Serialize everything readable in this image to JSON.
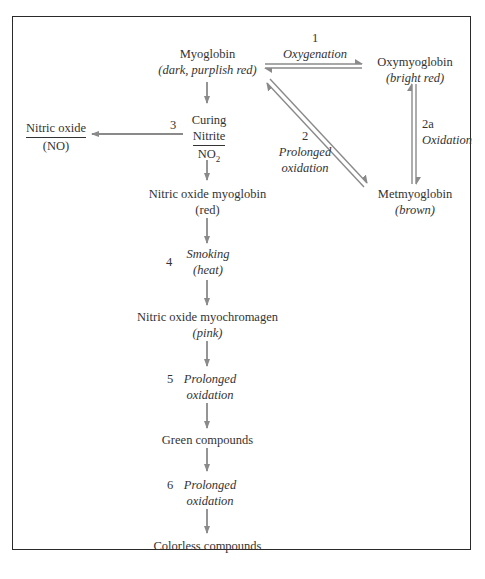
{
  "diagram": {
    "nodes": {
      "myoglobin": {
        "name": "Myoglobin",
        "color_desc": "(dark, purplish red)"
      },
      "oxymyoglobin": {
        "name": "Oxymyoglobin",
        "color_desc": "(bright red)"
      },
      "metmyoglobin": {
        "name": "Metmyoglobin",
        "color_desc": "(brown)"
      },
      "nitric_oxide": {
        "name": "Nitric oxide",
        "formula": "(NO)"
      },
      "nitric_oxide_myoglobin": {
        "name": "Nitric oxide myoglobin",
        "color_desc": "(red)"
      },
      "nitric_oxide_myochromagen": {
        "name": "Nitric oxide myochromagen",
        "color_desc": "(pink)"
      },
      "green_compounds": {
        "name": "Green compounds"
      },
      "colorless_compounds": {
        "name": "Colorless compounds"
      }
    },
    "steps": {
      "s1": {
        "num": "1",
        "label": "Oxygenation"
      },
      "s2": {
        "num": "2",
        "label_line1": "Prolonged",
        "label_line2": "oxidation"
      },
      "s2a": {
        "num": "2a",
        "label": "Oxidation"
      },
      "s3": {
        "num": "3",
        "label_line1": "Curing",
        "label_line2": "Nitrite",
        "formula": "NO",
        "formula_sub": "2"
      },
      "s4": {
        "num": "4",
        "label_line1": "Smoking",
        "label_line2": "(heat)"
      },
      "s5": {
        "num": "5",
        "label_line1": "Prolonged",
        "label_line2": "oxidation"
      },
      "s6": {
        "num": "6",
        "label_line1": "Prolonged",
        "label_line2": "oxidation"
      }
    },
    "colors": {
      "arrow": "#8a8a8a",
      "frame": "#2a2a2a",
      "text": "#333333"
    }
  }
}
